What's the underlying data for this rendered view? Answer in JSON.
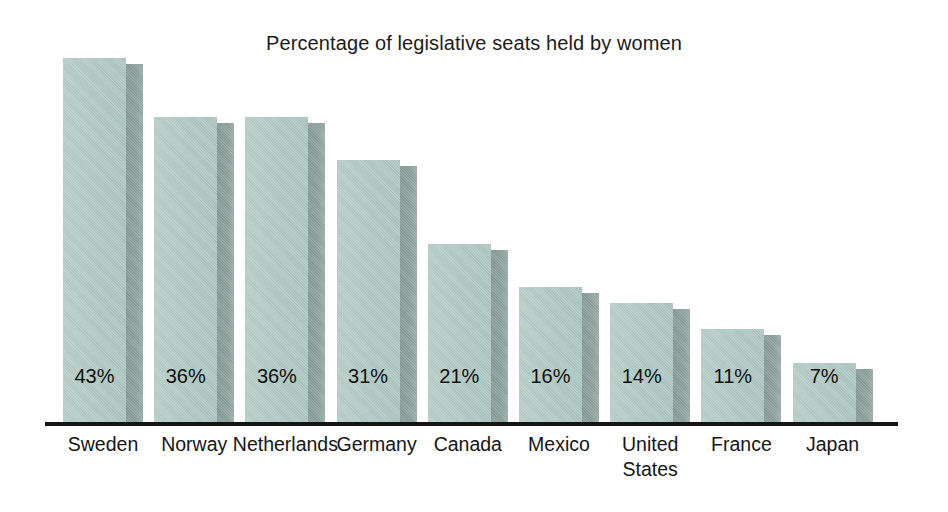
{
  "chart_data": {
    "type": "bar",
    "title": "Percentage of legislative seats held by women",
    "xlabel": "",
    "ylabel": "",
    "ylim": [
      0,
      47
    ],
    "grid": false,
    "legend": false,
    "unit": "%",
    "categories": [
      "Sweden",
      "Norway",
      "Netherlands",
      "Germany",
      "Canada",
      "Mexico",
      "United\nStates",
      "France",
      "Japan"
    ],
    "values": [
      43,
      36,
      36,
      31,
      21,
      16,
      14,
      11,
      7
    ],
    "value_labels": [
      "43%",
      "36%",
      "36%",
      "31%",
      "21%",
      "16%",
      "14%",
      "11%",
      "7%"
    ],
    "colors": {
      "bar_face": "#b2cac5",
      "bar_side": "#91a5a1",
      "axis": "#141414",
      "text": "#161616",
      "background": "#ffffff"
    }
  }
}
